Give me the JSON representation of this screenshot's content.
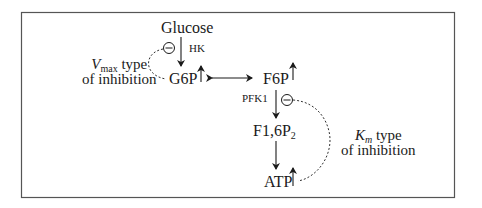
{
  "nodes": {
    "glucose": "Glucose",
    "g6p": "G6P",
    "f6p": "F6P",
    "f16p2": "F1,6P",
    "f16p2_sub": "2",
    "atp": "ATP"
  },
  "enzymes": {
    "hk": "HK",
    "pfk1": "PFK1"
  },
  "annotations": {
    "vmax_var": "V",
    "vmax_sub": "max",
    "vmax_rest": " type",
    "vmax_line2": "of inhibition",
    "km_var": "K",
    "km_sub": "m",
    "km_rest": " type",
    "km_line2": "of inhibition"
  },
  "symbols": {
    "inhibition": "⊖",
    "increase": "↑"
  },
  "colors": {
    "line": "#1a1a1a",
    "border": "#555555"
  }
}
